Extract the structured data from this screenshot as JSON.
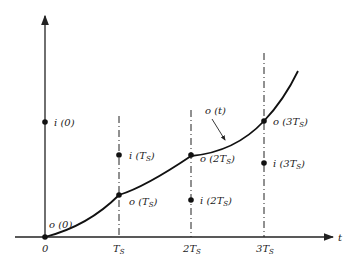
{
  "diagram": {
    "type": "sampling-timing-diagram",
    "axes": {
      "x_label": "t",
      "origin_label": "0",
      "ticks": [
        "T_S",
        "2T_S",
        "3T_S"
      ]
    },
    "tick_labels": {
      "t0": "0",
      "t1_main": "T",
      "t1_sub": "S",
      "t2_pre": "2",
      "t2_main": "T",
      "t2_sub": "S",
      "t3_pre": "3",
      "t3_main": "T",
      "t3_sub": "S"
    },
    "input_samples": [
      {
        "label": "i (0)",
        "pre": "i (0)"
      },
      {
        "label": "i (T_S)",
        "pre": "i (",
        "main": "T",
        "sub": "S",
        "post": ")"
      },
      {
        "label": "i (2T_S)",
        "pre": "i (2",
        "main": "T",
        "sub": "S",
        "post": ")"
      },
      {
        "label": "i (3T_S)",
        "pre": "i (3",
        "main": "T",
        "sub": "S",
        "post": ")"
      }
    ],
    "output_samples": [
      {
        "label": "o (0)",
        "pre": "o (0)"
      },
      {
        "label": "o (T_S)",
        "pre": "o (",
        "main": "T",
        "sub": "S",
        "post": ")"
      },
      {
        "label": "o (2T_S)",
        "pre": "o (2",
        "main": "T",
        "sub": "S",
        "post": ")"
      },
      {
        "label": "o (3T_S)",
        "pre": "o (3",
        "main": "T",
        "sub": "S",
        "post": ")"
      }
    ],
    "curve_label": "o (t)",
    "colors": {
      "ink": "#222222",
      "background": "#ffffff"
    }
  }
}
